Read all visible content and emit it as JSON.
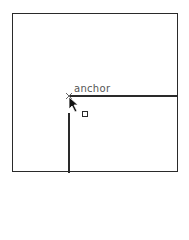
{
  "canvas": {
    "anchor_label": "anchor",
    "colors": {
      "stroke": "#2a2a2a",
      "label": "#555555",
      "background": "#ffffff"
    }
  },
  "icons": {
    "cursor": "arrow-cursor-icon",
    "anchor": "anchor-point-icon",
    "handle": "resize-handle-icon"
  }
}
